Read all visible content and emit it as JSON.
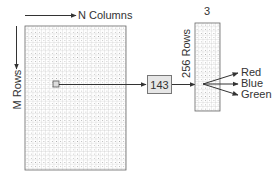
{
  "diagram": {
    "type": "indexed-color-lookup",
    "image_grid": {
      "columns_label": "N Columns",
      "rows_label": "M Rows",
      "selected_pixel_value": "143"
    },
    "color_table": {
      "columns_label": "3",
      "rows_label": "256 Rows"
    },
    "outputs": [
      {
        "label": "Red"
      },
      {
        "label": "Blue"
      },
      {
        "label": "Green"
      }
    ],
    "colors": {
      "line": "#333333",
      "grid_line": "#b5b5b5",
      "grid_border": "#666666",
      "value_box_fill": "#e6e6e6"
    }
  }
}
